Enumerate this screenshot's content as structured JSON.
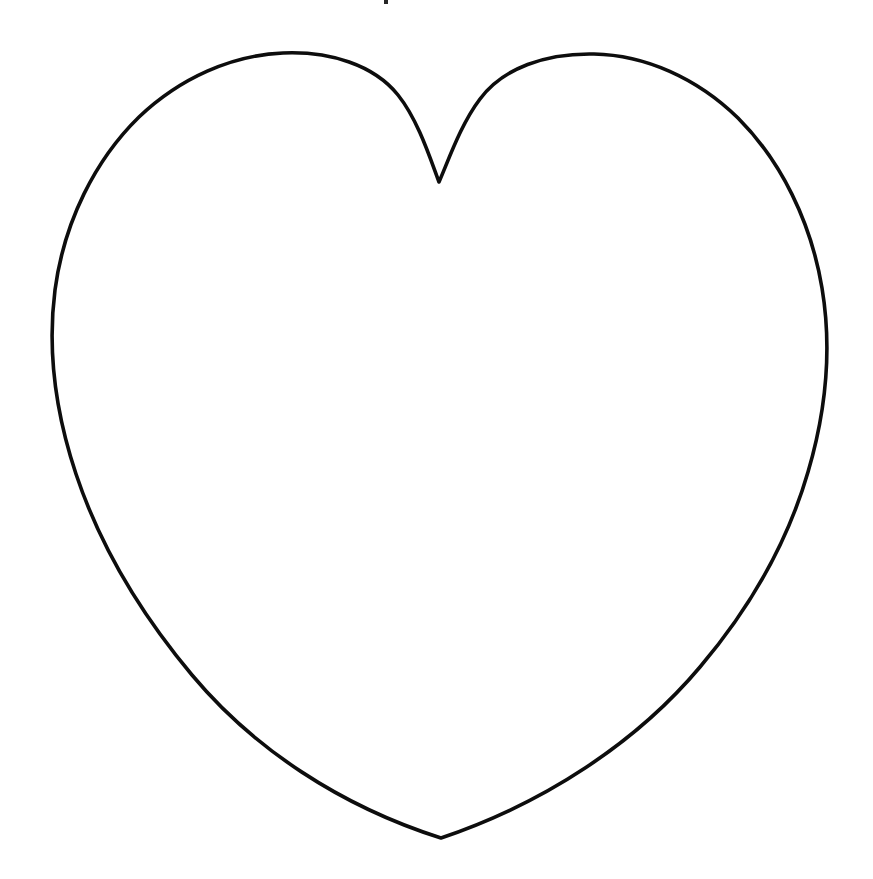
{
  "page": {
    "title": "Heart Outline Template",
    "canvas_width": 873,
    "canvas_height": 879,
    "background_color": "#ffffff",
    "description": "Plain black outline drawing of a symmetrical heart shape centered on a blank white page, in the style of a printable coloring or stencil template."
  },
  "artwork": {
    "name": "heart-outline",
    "stroke_color": "#0d0d0d",
    "fill_color": "none",
    "stroke_width": 3.6,
    "bounds": {
      "left": 53,
      "right": 822,
      "top": 53,
      "bottom": 838
    },
    "anchors": {
      "left_lobe_peak_x": 265,
      "left_lobe_peak_y": 53,
      "right_lobe_peak_x": 610,
      "right_lobe_peak_y": 55,
      "center_notch_x": 439,
      "center_notch_y": 182,
      "bottom_tip_x": 441,
      "bottom_tip_y": 838,
      "leftmost_x": 53,
      "leftmost_y": 305,
      "rightmost_x": 822,
      "rightmost_y": 300
    },
    "path_d": "M 439 182 C 430 158 418 120 398 95 C 374 65 330 51 283 53 C 232 55 180 78 139 117 C 95 160 64 222 55 290 C 47 352 56 414 76 474 C 100 546 141 614 192 675 C 253 748 340 806 441 838 C 545 803 637 742 700 667 C 750 608 788 541 808 472 C 826 411 832 348 822 288 C 811 222 781 161 738 118 C 697 78 645 55 594 54 C 546 53 503 68 480 99 C 461 124 449 159 439 182 Z"
  },
  "top_edge_artifact": {
    "name": "cropped-mark",
    "x": 384,
    "y": 0,
    "width": 4,
    "height": 4,
    "color": "#262626"
  }
}
